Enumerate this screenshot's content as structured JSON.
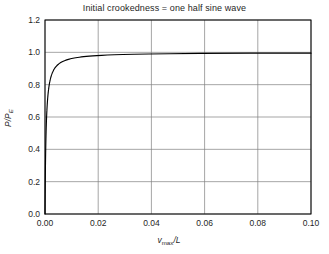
{
  "chart_data": {
    "type": "line",
    "title": "Initial crookedness = one half sine wave",
    "xlabel": "v_max/L",
    "ylabel": "P/P_E",
    "xlim": [
      0.0,
      0.1
    ],
    "ylim": [
      0.0,
      1.2
    ],
    "grid": true,
    "legend": null,
    "xticks": [
      "0.00",
      "0.02",
      "0.04",
      "0.06",
      "0.08",
      "0.10"
    ],
    "xtick_values": [
      0.0,
      0.02,
      0.04,
      0.06,
      0.08,
      0.1
    ],
    "yticks": [
      "0.0",
      "0.2",
      "0.4",
      "0.6",
      "0.8",
      "1.0",
      "1.2"
    ],
    "ytick_values": [
      0.0,
      0.2,
      0.4,
      0.6,
      0.8,
      1.0,
      1.2
    ],
    "series": [
      {
        "name": "P/PE vs vmax/L",
        "color": "#000000",
        "imperfection_ratio": 0.0004,
        "x": [
          0.0,
          0.0001,
          0.0002,
          0.0004,
          0.0006,
          0.0009,
          0.0012,
          0.0016,
          0.0021,
          0.0027,
          0.0036,
          0.0046,
          0.006,
          0.008,
          0.01,
          0.013,
          0.016,
          0.02,
          0.025,
          0.03,
          0.035,
          0.04,
          0.05,
          0.06,
          0.07,
          0.08,
          0.09,
          0.1
        ],
        "y": [
          0.0,
          0.2,
          0.333,
          0.5,
          0.6,
          0.692,
          0.75,
          0.8,
          0.84,
          0.871,
          0.9,
          0.92,
          0.938,
          0.952,
          0.962,
          0.97,
          0.976,
          0.98,
          0.984,
          0.987,
          0.989,
          0.99,
          0.992,
          0.993,
          0.994,
          0.995,
          0.996,
          0.996
        ]
      }
    ],
    "axis_title_parts": {
      "x_main": "v",
      "x_sub": "max",
      "x_tail": "/L",
      "y_main": "P/P",
      "y_sub": "E"
    }
  },
  "colors": {
    "curve": "#000000",
    "grid": "#808080",
    "frame": "#000000",
    "background": "#ffffff",
    "text": "#1f1f1f"
  }
}
